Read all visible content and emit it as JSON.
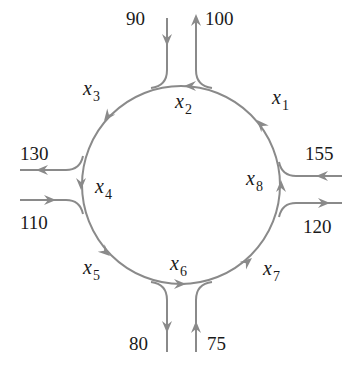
{
  "diagram": {
    "type": "traffic-flow-roundabout",
    "direction": "counterclockwise",
    "colors": {
      "line": "#8a8a8a",
      "text": "#1a1a1a",
      "background": "#ffffff"
    },
    "circle_segments": [
      {
        "id": "x1",
        "label": "x",
        "subscript": "1"
      },
      {
        "id": "x2",
        "label": "x",
        "subscript": "2"
      },
      {
        "id": "x3",
        "label": "x",
        "subscript": "3"
      },
      {
        "id": "x4",
        "label": "x",
        "subscript": "4"
      },
      {
        "id": "x5",
        "label": "x",
        "subscript": "5"
      },
      {
        "id": "x6",
        "label": "x",
        "subscript": "6"
      },
      {
        "id": "x7",
        "label": "x",
        "subscript": "7"
      },
      {
        "id": "x8",
        "label": "x",
        "subscript": "8"
      }
    ],
    "external_flows": {
      "top_in": {
        "value": "90",
        "direction": "in"
      },
      "top_out": {
        "value": "100",
        "direction": "out"
      },
      "left_out": {
        "value": "130",
        "direction": "out"
      },
      "left_in": {
        "value": "110",
        "direction": "in"
      },
      "bottom_out": {
        "value": "80",
        "direction": "out"
      },
      "bottom_in": {
        "value": "75",
        "direction": "in"
      },
      "right_in": {
        "value": "155",
        "direction": "in"
      },
      "right_out": {
        "value": "120",
        "direction": "out"
      }
    }
  }
}
